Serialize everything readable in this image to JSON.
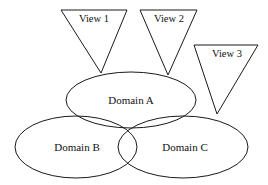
{
  "diagram": {
    "type": "venn-with-views",
    "background_color": "#ffffff",
    "stroke_color": "#1a1a1a",
    "label_color": "#111111",
    "views": [
      {
        "id": "view-1",
        "label": "View 1",
        "shape": "inverted-triangle",
        "top_left_x": 61,
        "top_right_x": 127,
        "top_y": 10,
        "apex_x": 101,
        "apex_y": 73,
        "label_x": 94,
        "label_y": 20,
        "points_to": "Domain A"
      },
      {
        "id": "view-2",
        "label": "View 2",
        "shape": "inverted-triangle",
        "top_left_x": 140,
        "top_right_x": 197,
        "top_y": 10,
        "apex_x": 168,
        "apex_y": 75,
        "label_x": 169,
        "label_y": 20,
        "points_to": "Domain A"
      },
      {
        "id": "view-3",
        "label": "View 3",
        "shape": "inverted-triangle",
        "top_left_x": 194,
        "top_right_x": 258,
        "top_y": 45,
        "apex_x": 217,
        "apex_y": 114,
        "label_x": 227,
        "label_y": 55,
        "points_to": "Domain A"
      }
    ],
    "domains": [
      {
        "id": "domain-a",
        "label": "Domain A",
        "shape": "ellipse",
        "cx": 131,
        "cy": 100,
        "rx": 65,
        "ry": 28,
        "label_x": 131,
        "label_y": 101
      },
      {
        "id": "domain-b",
        "label": "Domain B",
        "shape": "ellipse",
        "cx": 76,
        "cy": 147,
        "rx": 61,
        "ry": 31,
        "label_x": 77,
        "label_y": 148
      },
      {
        "id": "domain-c",
        "label": "Domain C",
        "shape": "ellipse",
        "cx": 183,
        "cy": 147,
        "rx": 65,
        "ry": 31,
        "label_x": 185,
        "label_y": 148
      }
    ],
    "overlaps": [
      "Domain A ∩ Domain B",
      "Domain A ∩ Domain C",
      "Domain B ∩ Domain C",
      "Domain A ∩ Domain B ∩ Domain C"
    ]
  }
}
